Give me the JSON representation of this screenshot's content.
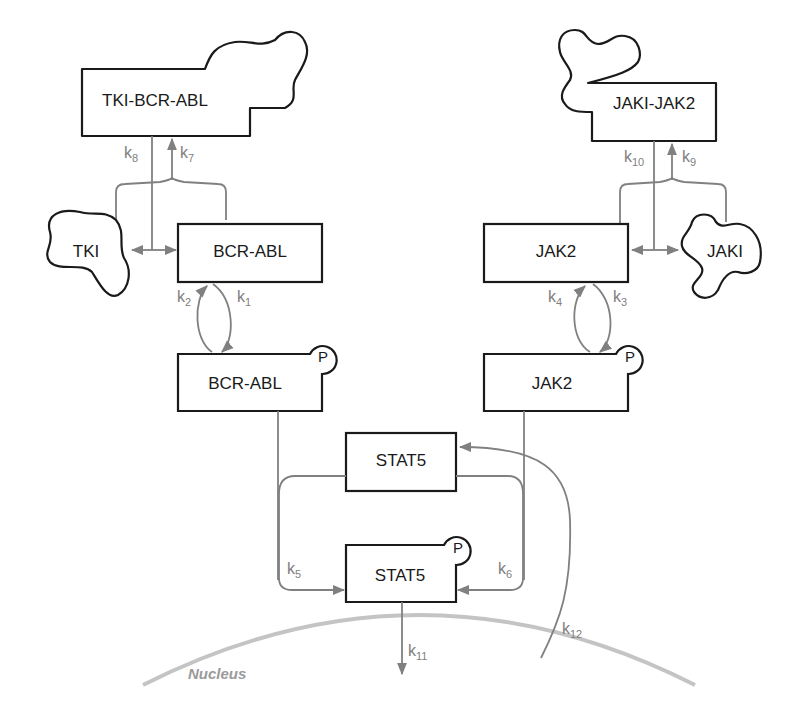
{
  "diagram": {
    "type": "signaling-pathway",
    "nodes": {
      "tki_bcr_abl": "TKI-BCR-ABL",
      "jaki_jak2": "JAKI-JAK2",
      "tki": "TKI",
      "bcr_abl": "BCR-ABL",
      "jak2": "JAK2",
      "jaki": "JAKI",
      "bcr_abl_p": "BCR-ABL",
      "jak2_p": "JAK2",
      "stat5": "STAT5",
      "stat5_p": "STAT5"
    },
    "phospho_tag": "P",
    "compartment": "Nucleus",
    "rates": {
      "k1": {
        "base": "k",
        "sub": "1"
      },
      "k2": {
        "base": "k",
        "sub": "2"
      },
      "k3": {
        "base": "k",
        "sub": "3"
      },
      "k4": {
        "base": "k",
        "sub": "4"
      },
      "k5": {
        "base": "k",
        "sub": "5"
      },
      "k6": {
        "base": "k",
        "sub": "6"
      },
      "k7": {
        "base": "k",
        "sub": "7"
      },
      "k8": {
        "base": "k",
        "sub": "8"
      },
      "k9": {
        "base": "k",
        "sub": "9"
      },
      "k10": {
        "base": "k",
        "sub": "10"
      },
      "k11": {
        "base": "k",
        "sub": "11"
      },
      "k12": {
        "base": "k",
        "sub": "12"
      }
    },
    "edges": [
      {
        "from": "TKI + BCR-ABL",
        "to": "TKI-BCR-ABL",
        "rate": "k7"
      },
      {
        "from": "TKI-BCR-ABL",
        "to": "TKI + BCR-ABL",
        "rate": "k8"
      },
      {
        "from": "JAK2 + JAKI",
        "to": "JAKI-JAK2",
        "rate": "k9"
      },
      {
        "from": "JAKI-JAK2",
        "to": "JAK2 + JAKI",
        "rate": "k10"
      },
      {
        "from": "BCR-ABL",
        "to": "BCR-ABL-P",
        "rate": "k1"
      },
      {
        "from": "BCR-ABL-P",
        "to": "BCR-ABL",
        "rate": "k2"
      },
      {
        "from": "JAK2",
        "to": "JAK2-P",
        "rate": "k3"
      },
      {
        "from": "JAK2-P",
        "to": "JAK2",
        "rate": "k4"
      },
      {
        "from": "STAT5",
        "to": "STAT5-P",
        "rate": "k5",
        "catalyst": "BCR-ABL-P"
      },
      {
        "from": "STAT5",
        "to": "STAT5-P",
        "rate": "k6",
        "catalyst": "JAK2-P"
      },
      {
        "from": "STAT5-P",
        "to": "Nucleus",
        "rate": "k11"
      },
      {
        "from": "Nucleus",
        "to": "STAT5",
        "rate": "k12"
      }
    ],
    "colors": {
      "node_stroke": "#1a1a1a",
      "edge": "#808080",
      "nucleus": "#c4c4c4",
      "nucleus_label": "#9a9a9a"
    }
  }
}
